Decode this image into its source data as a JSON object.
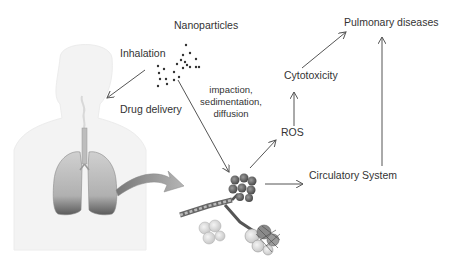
{
  "diagram": {
    "labels": {
      "nanoparticles": "Nanoparticles",
      "inhalation": "Inhalation",
      "drug_delivery": "Drug delivery",
      "deposition_line1": "impaction,",
      "deposition_line2": "sedimentation,",
      "deposition_line3": "diffusion",
      "ros": "ROS",
      "cytotoxicity": "Cytotoxicity",
      "pulmonary_diseases": "Pulmonary diseases",
      "circulatory_system": "Circulatory System"
    },
    "nodes": [
      {
        "id": "nanoparticles",
        "label": "Nanoparticles"
      },
      {
        "id": "human-body",
        "label": "Human body with lungs (illustration)"
      },
      {
        "id": "alveoli",
        "label": "Alveoli (illustration)"
      },
      {
        "id": "ros",
        "label": "ROS"
      },
      {
        "id": "cytotoxicity",
        "label": "Cytotoxicity"
      },
      {
        "id": "circulatory",
        "label": "Circulatory System"
      },
      {
        "id": "pulmonary",
        "label": "Pulmonary diseases"
      }
    ],
    "edges": [
      {
        "from": "nanoparticles",
        "to": "human-body",
        "label": "Inhalation / Drug delivery"
      },
      {
        "from": "nanoparticles",
        "to": "alveoli",
        "label": "impaction, sedimentation, diffusion"
      },
      {
        "from": "human-body",
        "to": "alveoli",
        "label": ""
      },
      {
        "from": "alveoli",
        "to": "ros",
        "label": ""
      },
      {
        "from": "ros",
        "to": "cytotoxicity",
        "label": ""
      },
      {
        "from": "cytotoxicity",
        "to": "pulmonary",
        "label": ""
      },
      {
        "from": "alveoli",
        "to": "circulatory",
        "label": ""
      },
      {
        "from": "circulatory",
        "to": "pulmonary",
        "label": ""
      }
    ],
    "colors": {
      "text": "#333333",
      "arrow": "#555555",
      "body_silhouette": "#f2f2f2",
      "lung": "#b5b5b5",
      "curved_arrow": "#9a9a9a"
    }
  }
}
